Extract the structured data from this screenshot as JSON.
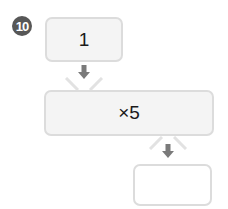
{
  "problem": {
    "number": "10",
    "steps": [
      {
        "id": "start",
        "value": "1"
      },
      {
        "id": "operation",
        "value": "×5"
      },
      {
        "id": "result",
        "value": ""
      }
    ]
  },
  "colors": {
    "badge": "#575757",
    "box_border": "#dcdcdc",
    "box_fill": "#f4f4f4",
    "arrow": "#7a7a7a"
  }
}
